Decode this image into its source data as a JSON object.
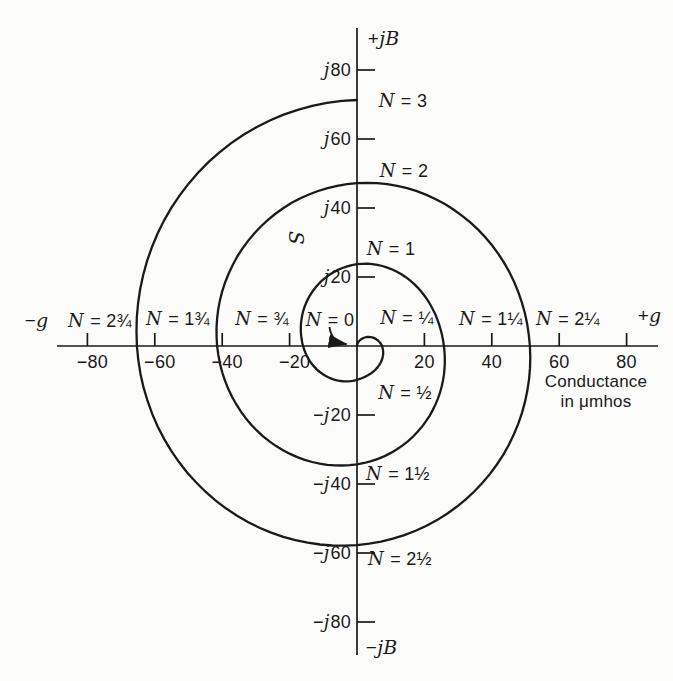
{
  "figure": {
    "ink_color": "#1a1a1a",
    "background_color": "#fcfcfb",
    "axis": {
      "top_label": "+jB",
      "bottom_label": "−jB",
      "left_label": "−g",
      "right_label": "+g"
    },
    "caption_line1": "Conductance",
    "caption_line2": "in μmhos",
    "curve_label": "S"
  },
  "chart_data": {
    "type": "line",
    "subtype": "spiral",
    "xlabel": "Conductance in μmhos",
    "grid": false,
    "x_axis": {
      "neg_label": "−g",
      "pos_label": "+g",
      "tick_values": [
        -80,
        -60,
        -40,
        -20,
        20,
        40,
        60,
        80
      ],
      "tick_labels": [
        "−80",
        "−60",
        "−40",
        "−20",
        "20",
        "40",
        "60",
        "80"
      ],
      "range": [
        -89,
        89
      ]
    },
    "y_axis": {
      "pos_label": "+jB",
      "neg_label": "−jB",
      "tick_values": [
        80,
        60,
        40,
        20,
        -20,
        -40,
        -60,
        -80
      ],
      "tick_labels": [
        "j80",
        "j60",
        "j40",
        "j20",
        "−j20",
        "−j40",
        "−j60",
        "−j80"
      ],
      "range": [
        -90,
        92
      ]
    },
    "series_name": "S",
    "spiral_direction": "clockwise from origin, one quarter turn per N = 1/4",
    "spiral_crossings": [
      {
        "N": 0,
        "label": "N = 0",
        "g": 0,
        "jb": 0
      },
      {
        "N": 0.25,
        "label": "N = ¼",
        "g": 7.4,
        "jb": 0
      },
      {
        "N": 0.5,
        "label": "N = ½",
        "g": 0,
        "jb": -9.8
      },
      {
        "N": 0.75,
        "label": "N = ¾",
        "g": -16,
        "jb": 0
      },
      {
        "N": 1,
        "label": "N = 1",
        "g": 0,
        "jb": 23.7
      },
      {
        "N": 1.25,
        "label": "N = 1¼",
        "g": 25.8,
        "jb": 0
      },
      {
        "N": 1.5,
        "label": "N = 1½",
        "g": 0,
        "jb": -34.3
      },
      {
        "N": 1.75,
        "label": "N = 1¾",
        "g": -41.5,
        "jb": 0
      },
      {
        "N": 2,
        "label": "N = 2",
        "g": 0,
        "jb": 47.2
      },
      {
        "N": 2.25,
        "label": "N = 2¼",
        "g": 51.3,
        "jb": 0
      },
      {
        "N": 2.5,
        "label": "N = 2½",
        "g": 0,
        "jb": -57.7
      },
      {
        "N": 2.75,
        "label": "N = 2¾",
        "g": -65.3,
        "jb": 0
      },
      {
        "N": 3,
        "label": "N = 3",
        "g": 0,
        "jb": 71.3
      }
    ]
  }
}
